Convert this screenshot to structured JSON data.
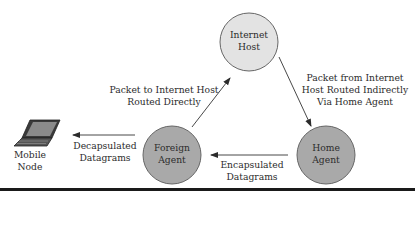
{
  "diagram": {
    "nodes": {
      "internet_host": {
        "line1": "Internet",
        "line2": "Host",
        "fill": "#e3e3e3"
      },
      "foreign_agent": {
        "line1": "Foreign",
        "line2": "Agent",
        "fill": "#a9a9a9"
      },
      "home_agent": {
        "line1": "Home",
        "line2": "Agent",
        "fill": "#a9a9a9"
      },
      "mobile_node": {
        "line1": "Mobile",
        "line2": "Node",
        "icon": "laptop-icon"
      }
    },
    "edges": {
      "fa_to_ih": {
        "line1": "Packet to Internet Host",
        "line2": "Routed Directly"
      },
      "ih_to_ha": {
        "line1": "Packet from Internet",
        "line2": "Host Routed Indirectly",
        "line3": "Via Home Agent"
      },
      "ha_to_fa": {
        "line1": "Encapsulated",
        "line2": "Datagrams"
      },
      "fa_to_mn": {
        "line1": "Decapsulated",
        "line2": "Datagrams"
      }
    },
    "colors": {
      "stroke": "#555555",
      "arrow": "#333333",
      "rule": "#1a1a1a"
    }
  }
}
